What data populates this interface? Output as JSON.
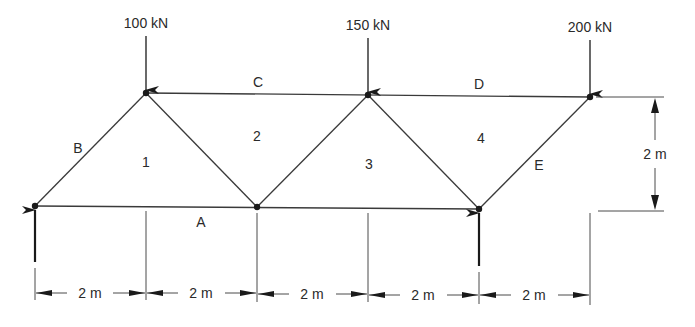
{
  "diagram": {
    "type": "truss",
    "loads": [
      {
        "label": "100 kN",
        "node": "top-1",
        "direction": "down"
      },
      {
        "label": "150 kN",
        "node": "top-2",
        "direction": "down"
      },
      {
        "label": "200 kN",
        "node": "top-3",
        "direction": "down"
      }
    ],
    "member_labels": {
      "A": "A",
      "B": "B",
      "C": "C",
      "D": "D",
      "E": "E"
    },
    "region_labels": {
      "r1": "1",
      "r2": "2",
      "r3": "3",
      "r4": "4"
    },
    "height_dimension": "2 m",
    "span_dimensions": [
      "2 m",
      "2 m",
      "2 m",
      "2 m",
      "2 m"
    ],
    "supports": [
      {
        "node": "bottom-left",
        "reaction": "up"
      },
      {
        "node": "bottom-right",
        "reaction": "up"
      }
    ],
    "colors": {
      "line": "#3a3a3a",
      "background": "#ffffff"
    }
  }
}
